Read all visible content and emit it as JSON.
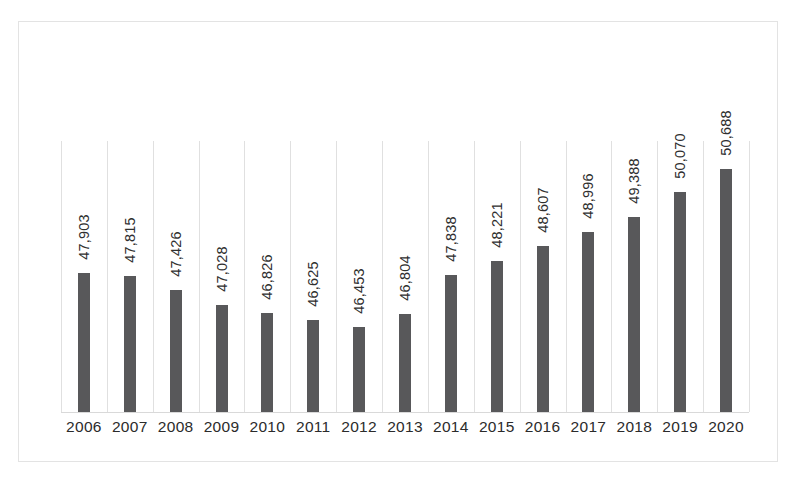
{
  "chart_data": {
    "type": "bar",
    "title": "",
    "subtitle": "",
    "xlabel": "",
    "ylabel": "",
    "categories": [
      "2006",
      "2007",
      "2008",
      "2009",
      "2010",
      "2011",
      "2012",
      "2013",
      "2014",
      "2015",
      "2016",
      "2017",
      "2018",
      "2019",
      "2020"
    ],
    "values": [
      47903,
      47815,
      47426,
      47028,
      46826,
      46625,
      46453,
      46804,
      47838,
      48221,
      48607,
      48996,
      49388,
      50070,
      50688
    ],
    "value_labels": [
      "47,903",
      "47,815",
      "47,426",
      "47,028",
      "46,826",
      "46,625",
      "46,453",
      "46,804",
      "47,838",
      "48,221",
      "48,607",
      "48,996",
      "49,388",
      "50,070",
      "50,688"
    ],
    "series": [
      {
        "name": "",
        "values": [
          47903,
          47815,
          47426,
          47028,
          46826,
          46625,
          46453,
          46804,
          47838,
          48221,
          48607,
          48996,
          49388,
          50070,
          50688
        ]
      }
    ],
    "ylim": [
      44160,
      51440
    ],
    "grid": "vertical-category-separators",
    "legend": "none",
    "data_labels": true,
    "data_label_orientation": "rotated-90-ccw",
    "bar_color": "#58585a",
    "gridline_color": "#e0e0e0",
    "axis_color": "#d9d9d9",
    "border_color": "#e3e3e3",
    "label_color": "#2b2b2b"
  }
}
